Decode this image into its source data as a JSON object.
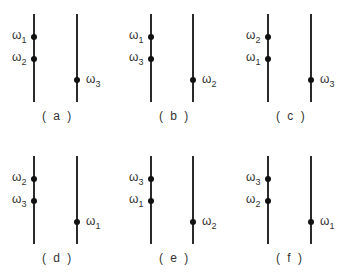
{
  "figure": {
    "panels": [
      {
        "caption": "( a )",
        "left_top": {
          "sym": "ω",
          "sub": "1"
        },
        "left_bottom": {
          "sym": "ω",
          "sub": "2"
        },
        "right": {
          "sym": "ω",
          "sub": "3"
        }
      },
      {
        "caption": "( b )",
        "left_top": {
          "sym": "ω",
          "sub": "1"
        },
        "left_bottom": {
          "sym": "ω",
          "sub": "3"
        },
        "right": {
          "sym": "ω",
          "sub": "2"
        }
      },
      {
        "caption": "( c )",
        "left_top": {
          "sym": "ω",
          "sub": "2"
        },
        "left_bottom": {
          "sym": "ω",
          "sub": "1"
        },
        "right": {
          "sym": "ω",
          "sub": "3"
        }
      },
      {
        "caption": "( d )",
        "left_top": {
          "sym": "ω",
          "sub": "2"
        },
        "left_bottom": {
          "sym": "ω",
          "sub": "3"
        },
        "right": {
          "sym": "ω",
          "sub": "1"
        }
      },
      {
        "caption": "( e )",
        "left_top": {
          "sym": "ω",
          "sub": "3"
        },
        "left_bottom": {
          "sym": "ω",
          "sub": "1"
        },
        "right": {
          "sym": "ω",
          "sub": "2"
        }
      },
      {
        "caption": "( f )",
        "left_top": {
          "sym": "ω",
          "sub": "3"
        },
        "left_bottom": {
          "sym": "ω",
          "sub": "2"
        },
        "right": {
          "sym": "ω",
          "sub": "1"
        }
      }
    ]
  }
}
